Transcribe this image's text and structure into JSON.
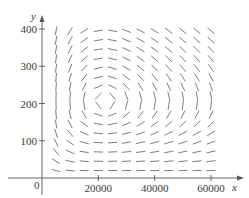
{
  "chart_data": {
    "type": "direction_field",
    "title": "",
    "xlabel": "x",
    "ylabel": "y",
    "origin_label": "0",
    "xlim": [
      0,
      63000
    ],
    "ylim": [
      0,
      430
    ],
    "x_ticks": [
      20000,
      40000,
      60000
    ],
    "x_tick_labels": [
      "20000",
      "40000",
      "60000"
    ],
    "y_ticks": [
      100,
      200,
      300,
      400
    ],
    "y_tick_labels": [
      "100",
      "200",
      "300",
      "400"
    ],
    "grid": false,
    "legend": null,
    "field": {
      "description": "Slope field circulating around an equilibrium point; segments vertical near y≈200 on the left/right of center, horizontal near x≈22000",
      "equilibrium": {
        "x": 22000,
        "y": 205
      },
      "x_samples": [
        5000,
        10000,
        15000,
        20000,
        25000,
        30000,
        35000,
        40000,
        45000,
        50000,
        55000,
        60000
      ],
      "y_samples": [
        20,
        45,
        70,
        95,
        120,
        145,
        170,
        195,
        220,
        245,
        270,
        295,
        320,
        345,
        370,
        395
      ]
    }
  },
  "colors": {
    "axis": "#555555",
    "segment": "#6e6e6e",
    "text": "#3a3a3a"
  }
}
